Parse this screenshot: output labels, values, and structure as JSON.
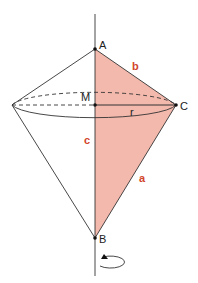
{
  "diagram": {
    "points": {
      "A": {
        "label": "A"
      },
      "B": {
        "label": "B"
      },
      "C": {
        "label": "C"
      },
      "M": {
        "label": "M"
      }
    },
    "segments": {
      "a": {
        "label": "a"
      },
      "b": {
        "label": "b"
      },
      "c": {
        "label": "c"
      },
      "r": {
        "label": "r"
      }
    },
    "colors": {
      "fill": "#f4b9ad",
      "stroke": "#333333",
      "segment_label": "#d2452c"
    },
    "rotation_symbol": "rotation-arrow"
  }
}
